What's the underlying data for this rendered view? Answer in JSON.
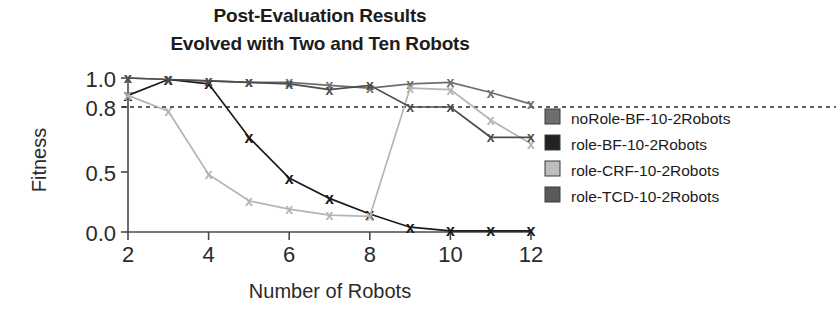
{
  "chart_data": {
    "type": "line",
    "title": "Post-Evaluation Results",
    "subtitle": "Evolved with Two and Ten Robots",
    "xlabel": "Number of Robots",
    "ylabel": "Fitness",
    "x": [
      2,
      3,
      4,
      5,
      6,
      7,
      8,
      9,
      10,
      11,
      12
    ],
    "xticks": [
      2,
      4,
      6,
      8,
      10,
      12
    ],
    "xtick_labels": [
      "2",
      "4",
      "6",
      "8",
      "10",
      "12"
    ],
    "yticks": [
      1.0,
      0.8,
      0.5,
      0.0
    ],
    "ytick_labels": [
      "1.0",
      "0.8",
      "0.5",
      "0.0"
    ],
    "xlim": [
      2,
      12
    ],
    "ylim": [
      0.0,
      1.0
    ],
    "grid": false,
    "legend_position": "right",
    "reference_line": {
      "value": 0.8,
      "style": "dashed",
      "color": "#2b2b2b"
    },
    "marker": "x",
    "series": [
      {
        "name": "noRole-BF-10-2Robots",
        "color": "#6e6e6e",
        "values": [
          1.0,
          0.99,
          0.98,
          0.97,
          0.97,
          0.95,
          0.93,
          0.96,
          0.97,
          0.9,
          0.82
        ]
      },
      {
        "name": "role-BF-10-2Robots",
        "color": "#1a1a1a",
        "values": [
          0.88,
          0.99,
          0.96,
          0.66,
          0.45,
          0.28,
          0.15,
          0.04,
          0.01,
          0.01,
          0.01
        ]
      },
      {
        "name": "role-CRF-10-2Robots",
        "color": "#b4b4b4",
        "values": [
          0.88,
          0.78,
          0.48,
          0.26,
          0.19,
          0.14,
          0.13,
          0.93,
          0.92,
          0.74,
          0.63
        ]
      },
      {
        "name": "role-TCD-10-2Robots",
        "color": "#4d4d4d",
        "values": [
          1.0,
          0.99,
          0.98,
          0.97,
          0.96,
          0.92,
          0.95,
          0.8,
          0.8,
          0.66,
          0.66
        ]
      }
    ]
  },
  "legend": {
    "items": [
      {
        "label": "noRole-BF-10-2Robots",
        "swatch": "#6e6e6e"
      },
      {
        "label": "role-BF-10-2Robots",
        "swatch": "#222222"
      },
      {
        "label": "role-CRF-10-2Robots",
        "swatch": "#bdbdbd"
      },
      {
        "label": "role-TCD-10-2Robots",
        "swatch": "#5a5a5a"
      }
    ]
  }
}
